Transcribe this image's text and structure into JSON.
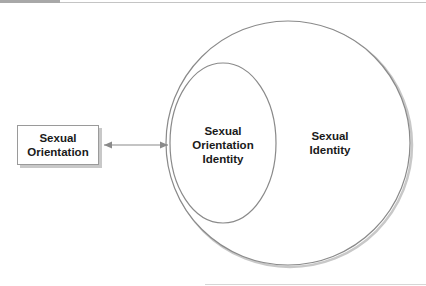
{
  "diagram": {
    "type": "venn-relationship",
    "nodes": {
      "sexual_orientation": {
        "lines": [
          "Sexual",
          "Orientation"
        ]
      },
      "sexual_orientation_identity": {
        "lines": [
          "Sexual",
          "Orientation",
          "Identity"
        ]
      },
      "sexual_identity": {
        "lines": [
          "Sexual",
          "Identity"
        ]
      }
    },
    "edges": [
      {
        "from": "sexual_orientation",
        "to": "sexual_orientation_identity",
        "type": "bidirectional-arrow"
      }
    ],
    "containment": [
      {
        "outer": "sexual_identity",
        "inner": "sexual_orientation_identity"
      }
    ],
    "colors": {
      "stroke": "#8a8a8a",
      "shadow": "#c8c8c8",
      "text": "#1a1a1a",
      "background": "#ffffff"
    }
  }
}
